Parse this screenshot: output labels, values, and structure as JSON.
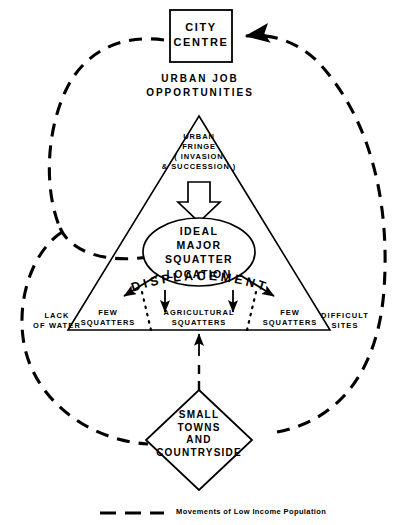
{
  "diagram": {
    "title_nodes": {
      "city_centre": "CITY\nCENTRE",
      "urban_job": "URBAN  JOB\nOPPORTUNITIES",
      "urban_fringe": "URBAN\nFRINGE\n( INVASION\n&  SUCCESSION )",
      "ideal_location": "IDEAL\nMAJOR\nSQUATTER\nLOCATION",
      "displacement": "DISPLACEMENT",
      "small_towns": "SMALL\nTOWNS\nAND\nCOUNTRYSIDE"
    },
    "corner_labels": {
      "left": "LACK\nOF  WATER",
      "right": "DIFFICULT\nSITES"
    },
    "zone_labels": {
      "left_few": "FEW\nSQUATTERS",
      "centre": "AGRICULTURAL\nSQUATTERS",
      "right_few": "FEW\nSQUATTERS"
    },
    "legend": {
      "text": "Movements of Low Income Population",
      "line_style": "dashed"
    },
    "colors": {
      "ink": "#000000",
      "background": "#ffffff"
    },
    "shapes": {
      "city_centre_shape": "rectangle",
      "ideal_location_shape": "ellipse",
      "small_towns_shape": "diamond",
      "main_shape": "triangle",
      "fringe_arrow_shape": "block-down-arrow"
    }
  }
}
